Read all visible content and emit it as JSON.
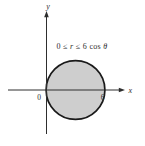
{
  "figure": {
    "inequality": {
      "prefix": "0 ≤ ",
      "r_variable": "r",
      "middle": " ≤ 6 cos ",
      "theta_variable": "θ",
      "full": "0 ≤ r ≤ 6 cos θ"
    },
    "axes": {
      "x_label": "x",
      "y_label": "y"
    },
    "ticks": {
      "origin": "0",
      "x_intercept": "6"
    },
    "geometry": {
      "shape": "circle",
      "shaded": true,
      "x_span": [
        0,
        6
      ],
      "center_on_x_axis": 3,
      "radius_axis_units": 3
    },
    "colors": {
      "background": "#ffffff",
      "disk_fill": "#cecece",
      "disk_stroke": "#1a1a1a",
      "axis": "#2e2e2e",
      "text": "#2e2e2e"
    }
  }
}
